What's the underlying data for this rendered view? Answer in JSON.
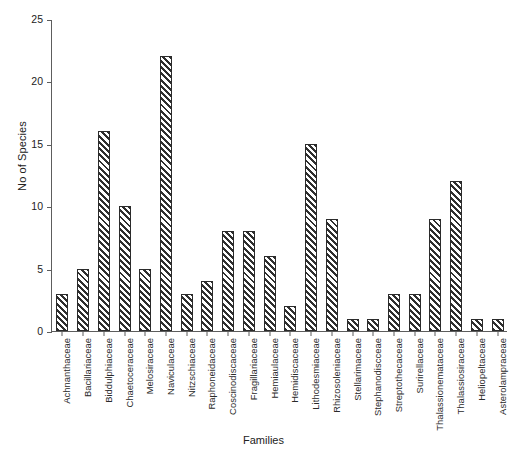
{
  "chart_data": {
    "type": "bar",
    "title": "",
    "xlabel": "Families",
    "ylabel": "No of Species",
    "ylim": [
      0,
      25
    ],
    "yticks": [
      0,
      5,
      10,
      15,
      20,
      25
    ],
    "grid": false,
    "legend": null,
    "categories": [
      "Achnanthaceae",
      "Bacillariaceae",
      "Biddulphiaceae",
      "Chaetoceraceae",
      "Melosiraceae",
      "Naviculaceae",
      "Nitzschiaceae",
      "Raphoneidaceae",
      "Coscinodiscaceae",
      "Fragillariaceae",
      "Hemiaulaceae",
      "Hemidiscaceae",
      "Lithodesmiaceae",
      "Rhizosoleniaceae",
      "Stellarimaceae",
      "Stephanodiscceae",
      "Streptothecaceae",
      "Surirellaceae",
      "Thalassionemataceae",
      "Thalassiosiraceae",
      "Heliopeltaceae",
      "Asterolampraceae"
    ],
    "values": [
      3,
      5,
      16,
      10,
      5,
      22,
      3,
      4,
      8,
      8,
      6,
      2,
      15,
      9,
      1,
      1,
      3,
      3,
      9,
      12,
      1,
      1
    ],
    "colors": {
      "bar_fill": "#ffffff",
      "bar_hatch": "#2f2f2f",
      "bar_edge": "#2b2b2b",
      "axis": "#5d5d5d",
      "text": "#222222",
      "background": "#ffffff"
    }
  }
}
